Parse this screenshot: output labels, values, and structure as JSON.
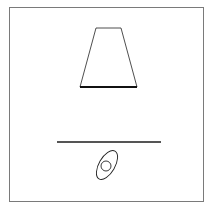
{
  "diagram": {
    "colors": {
      "frame": "#7a7a7a",
      "stroke": "#222222",
      "plate": "#555555",
      "background": "#ffffff"
    },
    "shapes": {
      "trapezoid": {
        "top_left": [
          96,
          28
        ],
        "top_right": [
          121,
          28
        ],
        "bottom_left": [
          80,
          87
        ],
        "bottom_right": [
          137,
          87
        ]
      },
      "base_bar": {
        "x1": 80,
        "x2": 137,
        "y": 87
      },
      "plate_line": {
        "x1": 57,
        "x2": 161,
        "y": 142
      },
      "ellipse": {
        "cx": 107,
        "cy": 165,
        "rx": 8,
        "ry": 16,
        "rotate": 30
      },
      "inner_circle": {
        "cx": 106,
        "cy": 166,
        "r": 5
      }
    }
  }
}
